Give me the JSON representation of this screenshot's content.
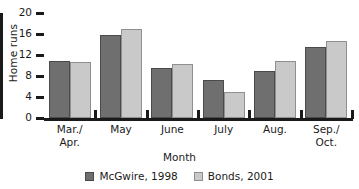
{
  "chart_data": {
    "type": "bar",
    "title": "",
    "xlabel": "Month",
    "ylabel": "Home runs",
    "categories": [
      "Mar./\nApr.",
      "May",
      "June",
      "July",
      "Aug.",
      "Sep./\nOct."
    ],
    "series": [
      {
        "name": "McGwire, 1998",
        "color": "#706f70",
        "values": [
          10.8,
          15.8,
          9.5,
          7.2,
          8.9,
          13.5
        ]
      },
      {
        "name": "Bonds, 2001",
        "color": "#c9c9c9",
        "values": [
          10.7,
          17.0,
          10.2,
          5.0,
          10.8,
          14.7
        ]
      }
    ],
    "ylim": [
      0,
      20
    ],
    "yticks": [
      0,
      4,
      8,
      12,
      16,
      20
    ],
    "grid": false,
    "legend_position": "bottom"
  }
}
